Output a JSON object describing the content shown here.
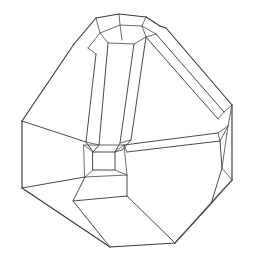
{
  "figure": {
    "canvas_width": 253,
    "canvas_height": 263,
    "background_color": "#ffffff",
    "line_color": "#4a4a4a",
    "line_width": 1,
    "style": "wireframe outline, no shading, no labels",
    "view": "three-quarter perspective"
  },
  "geometry": {
    "description": "Convex polyhedron with large pentagonal and hexagonal faces separated by narrow beveled band facets; a small square facet sits at the center of the figure where three bevels meet; a cluster of small facets forms a cap at the top.",
    "outline": [
      [
        96,
        16
      ],
      [
        118,
        13
      ],
      [
        146,
        17
      ],
      [
        168,
        27
      ],
      [
        232,
        105
      ],
      [
        232,
        180
      ],
      [
        211,
        204
      ],
      [
        175,
        243
      ],
      [
        110,
        247
      ],
      [
        60,
        226
      ],
      [
        22,
        188
      ],
      [
        22,
        121
      ],
      [
        74,
        44
      ]
    ],
    "center_square": {
      "top_left": [
        93,
        152
      ],
      "top_right": [
        115,
        152
      ],
      "bottom_right": [
        115,
        170
      ],
      "bottom_left": [
        93,
        170
      ]
    },
    "bevel_bands": [
      {
        "name": "upper-left-band",
        "from": [
          93,
          152
        ],
        "to": [
          99,
          36
        ],
        "width_px": 9
      },
      {
        "name": "upper-right-band",
        "from": [
          115,
          152
        ],
        "to": [
          148,
          45
        ],
        "width_px": 9
      },
      {
        "name": "right-horizontal-band",
        "from": [
          115,
          161
        ],
        "to": [
          222,
          140
        ],
        "width_px": 7
      },
      {
        "name": "upper-right-diagonal-band",
        "from": [
          157,
          34
        ],
        "to": [
          228,
          112
        ],
        "width_px": 8
      }
    ],
    "face_count_visible": 14,
    "vertex_count_visible": 28
  }
}
